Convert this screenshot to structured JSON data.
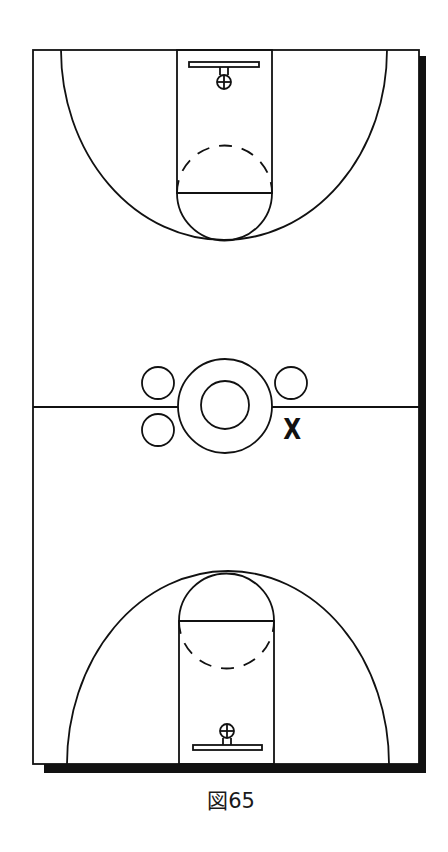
{
  "figure": {
    "caption": "図65",
    "type": "basketball full-court diagram"
  },
  "court": {
    "line_color": "#111111",
    "shadow_color": "#111111",
    "background": "#ffffff"
  },
  "players": {
    "circles": [
      {
        "id": "player-upper-left",
        "cx": 158,
        "cy": 383
      },
      {
        "id": "player-lower-left",
        "cx": 158,
        "cy": 430
      },
      {
        "id": "player-upper-right",
        "cx": 291,
        "cy": 383
      }
    ],
    "defender_marker": "X"
  }
}
